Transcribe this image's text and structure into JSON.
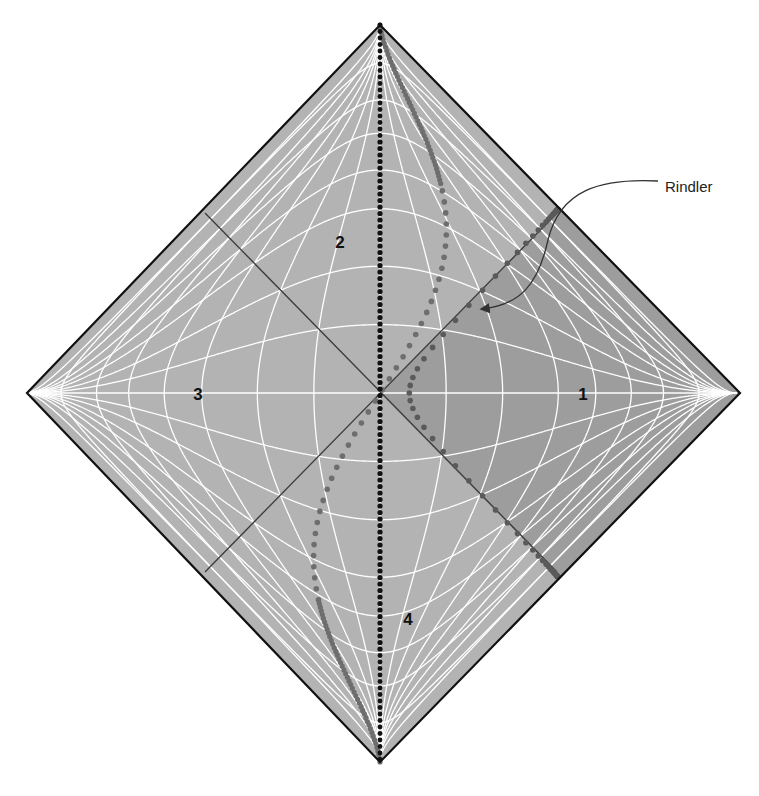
{
  "diagram": {
    "regions": [
      {
        "id": "1",
        "label": "1",
        "x": 583,
        "y": 400
      },
      {
        "id": "2",
        "label": "2",
        "x": 340,
        "y": 248
      },
      {
        "id": "3",
        "label": "3",
        "x": 198,
        "y": 400
      },
      {
        "id": "4",
        "label": "4",
        "x": 408,
        "y": 625
      }
    ],
    "callout": {
      "label": "Rindler",
      "label_x": 665,
      "label_y": 187
    },
    "geometry": {
      "top": [
        380,
        25
      ],
      "right": [
        740,
        393
      ],
      "bottom": [
        380,
        762
      ],
      "left": [
        27,
        393
      ],
      "center": [
        380,
        393
      ]
    },
    "colors": {
      "background": "#ffffff",
      "fill": "#b3b3b3",
      "rindler_fill": "#9d9d9d",
      "grid": "#ffffff",
      "border": "#111111",
      "horizon": "#3a3a3a",
      "inertial_worldline": "#111111",
      "oscillating_worldline": "#6e6e6e",
      "rindler_worldline": "#5a5a5a",
      "callout": "#333333"
    },
    "worldlines": [
      {
        "name": "inertial-observer",
        "style": "black dotted vertical"
      },
      {
        "name": "oscillating-observer",
        "style": "grey dotted S-curve"
      },
      {
        "name": "rindler-observer",
        "style": "grey dotted hyperbola"
      }
    ]
  }
}
